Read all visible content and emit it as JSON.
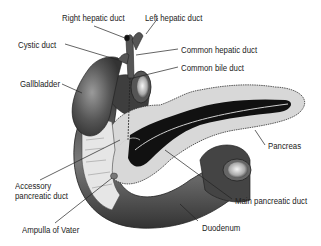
{
  "diagram": {
    "colors": {
      "background": "#ffffff",
      "organ_dark": "#4a4a4a",
      "organ_mid": "#6e6e6e",
      "pancreas_fill": "#d8d8d8",
      "duct_fill": "#111111",
      "leader_line": "#222222",
      "text": "#222222"
    },
    "labels": [
      {
        "id": "right-hepatic-duct",
        "text": "Right hepatic duct",
        "x": 62,
        "y": 13
      },
      {
        "id": "left-hepatic-duct",
        "text": "Left hepatic duct",
        "x": 145,
        "y": 13
      },
      {
        "id": "cystic-duct",
        "text": "Cystic duct",
        "x": 18,
        "y": 40
      },
      {
        "id": "common-hepatic-duct",
        "text": "Common hepatic duct",
        "x": 181,
        "y": 45
      },
      {
        "id": "common-bile-duct",
        "text": "Common bile duct",
        "x": 181,
        "y": 63
      },
      {
        "id": "gallbladder",
        "text": "Gallbladder",
        "x": 20,
        "y": 79
      },
      {
        "id": "pancreas",
        "text": "Pancreas",
        "x": 268,
        "y": 141
      },
      {
        "id": "accessory-pancreatic-duct",
        "text": "Accessory\npancreatic duct",
        "x": 15,
        "y": 181
      },
      {
        "id": "main-pancreatic-duct",
        "text": "Main pancreatic duct",
        "x": 235,
        "y": 196
      },
      {
        "id": "ampulla-of-vater",
        "text": "Ampulla of Vater",
        "x": 22,
        "y": 225
      },
      {
        "id": "duodenum",
        "text": "Duodenum",
        "x": 202,
        "y": 223
      }
    ]
  }
}
